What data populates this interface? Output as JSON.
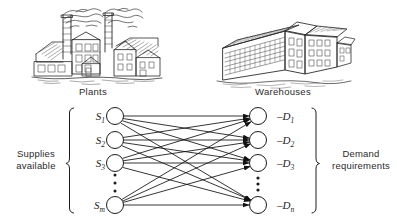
{
  "figure": {
    "background_color": "#ffffff",
    "ink_color": "#1c1c1c"
  },
  "illustrations": [
    {
      "name": "factory-illustration",
      "caption": "Plants",
      "description": "line drawing of a factory with two smokestacks emitting smoke and sawtooth roof workshops"
    },
    {
      "name": "warehouse-illustration",
      "caption": "Warehouses",
      "description": "line drawing of a multi-story warehouse building with rows of windows"
    }
  ],
  "captions": {
    "plants": "Plants",
    "warehouses": "Warehouses"
  },
  "labels": {
    "supplies": "Supplies\navailable",
    "supplies_line1": "Supplies",
    "supplies_line2": "available",
    "demand": "Demand\nrequirements",
    "demand_line1": "Demand",
    "demand_line2": "requirements"
  },
  "network": {
    "type": "complete-bipartite",
    "edge_direction": "supply-to-demand",
    "arrowheads": "at demand nodes",
    "supply_nodes": [
      {
        "id": "s1",
        "label": "S",
        "subscript": "1",
        "cx": 115,
        "cy": 116
      },
      {
        "id": "s2",
        "label": "S",
        "subscript": "2",
        "cx": 115,
        "cy": 140
      },
      {
        "id": "s3",
        "label": "S",
        "subscript": "3",
        "cx": 115,
        "cy": 163
      },
      {
        "id": "sm",
        "label": "S",
        "subscript": "m",
        "cx": 115,
        "cy": 205
      }
    ],
    "demand_nodes": [
      {
        "id": "d1",
        "label": "–D",
        "subscript": "1",
        "cx": 258,
        "cy": 116
      },
      {
        "id": "d2",
        "label": "–D",
        "subscript": "2",
        "cx": 258,
        "cy": 140
      },
      {
        "id": "d3",
        "label": "–D",
        "subscript": "3",
        "cx": 258,
        "cy": 163
      },
      {
        "id": "dn",
        "label": "–D",
        "subscript": "n",
        "cx": 258,
        "cy": 205
      }
    ],
    "ellipsis_dots": 3,
    "node_radius": 8.5
  },
  "node_text": {
    "s1": "S",
    "s1_sub": "1",
    "s2": "S",
    "s2_sub": "2",
    "s3": "S",
    "s3_sub": "3",
    "sm": "S",
    "sm_sub": "m",
    "d1": "–D",
    "d1_sub": "1",
    "d2": "–D",
    "d2_sub": "2",
    "d3": "–D",
    "d3_sub": "3",
    "dn": "–D",
    "dn_sub": "n"
  }
}
